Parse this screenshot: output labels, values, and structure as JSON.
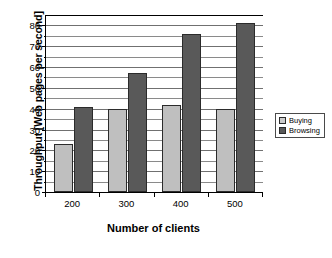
{
  "chart_data": {
    "type": "bar",
    "title": "",
    "xlabel": "Number of clients",
    "ylabel": "Throughput [Web pages per second]",
    "categories": [
      "200",
      "300",
      "400",
      "500"
    ],
    "series": [
      {
        "name": "Buying",
        "color": "#bfbfbf",
        "values": [
          23,
          40,
          42,
          40
        ]
      },
      {
        "name": "Browsing",
        "color": "#595959",
        "values": [
          41,
          57,
          76,
          81
        ]
      }
    ],
    "ylim": [
      0,
      85
    ],
    "y_major_ticks": [
      0,
      10,
      20,
      30,
      40,
      50,
      60,
      70,
      80
    ],
    "y_minor_ticks": [
      5,
      15,
      25,
      35,
      45,
      55,
      65,
      75
    ],
    "y_tick_labels": [
      "0",
      "10",
      "20",
      "30",
      "40",
      "50",
      "60",
      "70",
      "80"
    ],
    "grid": true,
    "legend_position": "right"
  }
}
